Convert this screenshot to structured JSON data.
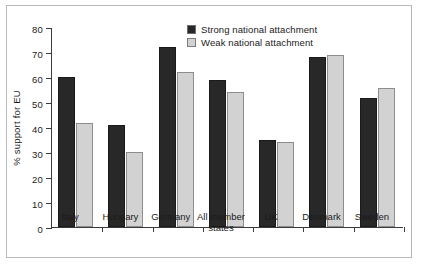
{
  "chart_data": {
    "type": "bar",
    "title": "",
    "xlabel": "",
    "ylabel": "% support for EU",
    "ylim": [
      0,
      80
    ],
    "yticks": [
      0,
      10,
      20,
      30,
      40,
      50,
      60,
      70,
      80
    ],
    "ytick_labels": [
      "0",
      "10",
      "20",
      "30",
      "40",
      "50",
      "60",
      "70",
      "80"
    ],
    "grid": false,
    "legend_position": "top-center",
    "categories": [
      "Italy",
      "Hungary",
      "Germany",
      "All member\nstates",
      "UK",
      "Denmark",
      "Sweden"
    ],
    "series": [
      {
        "name": "Strong national attachment",
        "color": "#282828",
        "values": [
          60,
          41,
          72,
          59,
          35,
          68,
          51.5
        ]
      },
      {
        "name": "Weak national attachment",
        "color": "#d2d2d2",
        "values": [
          41.5,
          30,
          62,
          54,
          34,
          69,
          55.5
        ]
      }
    ]
  },
  "legend": {
    "items": [
      {
        "label": "Strong national attachment",
        "swatch": "strong"
      },
      {
        "label": "Weak national attachment",
        "swatch": "weak"
      }
    ]
  },
  "axis": {
    "y_title": "% support for EU"
  }
}
